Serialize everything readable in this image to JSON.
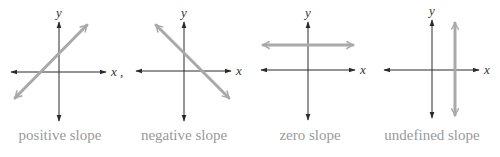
{
  "figure": {
    "panels": [
      {
        "id": "positive",
        "caption": "positive slope",
        "x_label": "x",
        "y_label": "y",
        "x_label_suffix": ",",
        "origin": [
          59,
          72
        ],
        "x_axis": [
          11,
          106
        ],
        "y_axis": [
          22,
          121
        ],
        "line": [
          [
            15,
            98
          ],
          [
            87,
            25
          ]
        ],
        "caption_x": 60
      },
      {
        "id": "negative",
        "caption": "negative slope",
        "x_label": "x",
        "y_label": "y",
        "x_label_suffix": "",
        "origin": [
          184,
          71
        ],
        "x_axis": [
          136,
          231
        ],
        "y_axis": [
          22,
          121
        ],
        "line": [
          [
            156,
            25
          ],
          [
            229,
            98
          ]
        ],
        "caption_x": 184
      },
      {
        "id": "zero",
        "caption": "zero slope",
        "x_label": "x",
        "y_label": "y",
        "x_label_suffix": "",
        "origin": [
          308,
          70
        ],
        "x_axis": [
          261,
          355
        ],
        "y_axis": [
          22,
          120
        ],
        "line": [
          [
            263,
            45
          ],
          [
            353,
            45
          ]
        ],
        "caption_x": 310
      },
      {
        "id": "undefined",
        "caption": "undefined slope",
        "x_label": "x",
        "y_label": "y",
        "x_label_suffix": "",
        "origin": [
          432,
          70
        ],
        "x_axis": [
          384,
          479
        ],
        "y_axis": [
          20,
          118
        ],
        "line": [
          [
            455,
            23
          ],
          [
            455,
            115
          ]
        ],
        "caption_x": 432
      }
    ],
    "colors": {
      "axis": "#2a2a2a",
      "line": "#a9a9a9",
      "caption": "#9a9a9a"
    }
  }
}
